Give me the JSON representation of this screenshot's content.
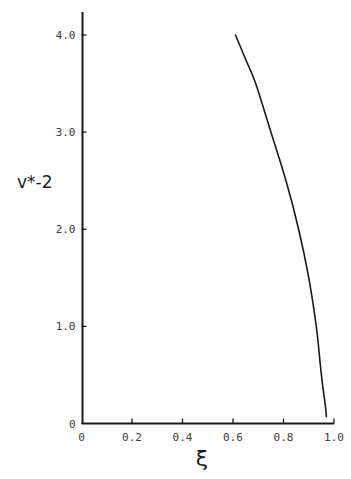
{
  "chart_data": {
    "type": "line",
    "title": "",
    "xlabel": "ξ",
    "ylabel": "v*-2",
    "xlim": [
      0,
      1.0
    ],
    "ylim": [
      0,
      4.0
    ],
    "grid": false,
    "legend": null,
    "x_ticks": [
      "0",
      "0.2",
      "0.4",
      "0.6",
      "0.8",
      "1.0"
    ],
    "y_ticks": [
      "0",
      "1.0",
      "2.0",
      "3.0",
      "4.0"
    ],
    "series": [
      {
        "name": "curve",
        "color": "#1a1a1a",
        "x": [
          0.61,
          0.65,
          0.69,
          0.75,
          0.81,
          0.86,
          0.9,
          0.93,
          0.95,
          0.965,
          0.97
        ],
        "y": [
          4.0,
          3.75,
          3.5,
          3.0,
          2.5,
          2.0,
          1.5,
          1.0,
          0.5,
          0.2,
          0.07
        ]
      }
    ]
  },
  "axes": {
    "x_label": "ξ",
    "y_label": "v*-2",
    "x_ticks": [
      "0",
      "0.2",
      "0.4",
      "0.6",
      "0.8",
      "1.0"
    ],
    "y_ticks": [
      "0",
      "1.0",
      "2.0",
      "3.0",
      "4.0"
    ]
  },
  "colors": {
    "line": "#1a1a1a",
    "axis": "#1a1a1a",
    "text": "#3a3a3a"
  }
}
